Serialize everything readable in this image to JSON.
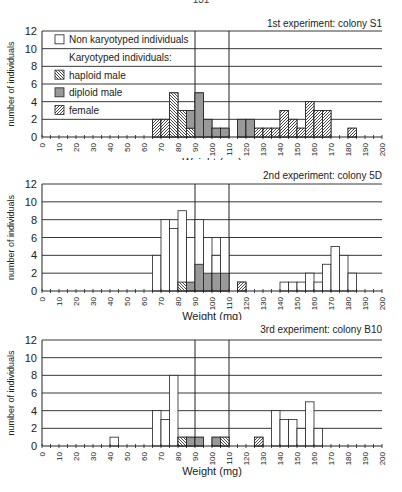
{
  "page_number": "131",
  "legend": {
    "non_karyotyped": "Non karyotyped individuals",
    "karyotyped_header": "Karyotyped individuals:",
    "haploid": "haploid male",
    "diploid": "diploid male",
    "female": "female"
  },
  "chart_data": [
    {
      "type": "bar",
      "title": "1st experiment: colony S1",
      "xlabel": "Weight (mg)",
      "ylabel": "number of individuals",
      "xlim": [
        0,
        200
      ],
      "ylim": [
        0,
        12
      ],
      "xticks": [
        0,
        10,
        20,
        30,
        40,
        50,
        60,
        70,
        80,
        90,
        100,
        110,
        120,
        130,
        140,
        150,
        160,
        170,
        180,
        190,
        200
      ],
      "yticks": [
        0,
        2,
        4,
        6,
        8,
        10,
        12
      ],
      "bin_width": 5,
      "reference_lines_x": [
        90,
        110
      ],
      "legend_position": "upper-left",
      "bins": [
        {
          "x": 65,
          "total": 2,
          "female": 2
        },
        {
          "x": 70,
          "total": 2,
          "female": 2
        },
        {
          "x": 75,
          "total": 5,
          "haploid": 5
        },
        {
          "x": 80,
          "total": 3,
          "haploid": 3
        },
        {
          "x": 85,
          "total": 3,
          "haploid": 1,
          "diploid": 2
        },
        {
          "x": 90,
          "total": 5,
          "diploid": 5
        },
        {
          "x": 95,
          "total": 2,
          "diploid": 2
        },
        {
          "x": 100,
          "total": 1,
          "diploid": 1
        },
        {
          "x": 105,
          "total": 1,
          "diploid": 1
        },
        {
          "x": 115,
          "total": 2,
          "diploid": 2
        },
        {
          "x": 120,
          "total": 2,
          "diploid": 2
        },
        {
          "x": 125,
          "total": 1,
          "female": 1
        },
        {
          "x": 130,
          "total": 1,
          "female": 1
        },
        {
          "x": 135,
          "total": 1,
          "female": 1
        },
        {
          "x": 140,
          "total": 3,
          "female": 3
        },
        {
          "x": 145,
          "total": 2,
          "female": 2
        },
        {
          "x": 150,
          "total": 1,
          "female": 1
        },
        {
          "x": 155,
          "total": 4,
          "female": 4
        },
        {
          "x": 160,
          "total": 3,
          "female": 3
        },
        {
          "x": 165,
          "total": 3,
          "female": 3
        },
        {
          "x": 180,
          "total": 1,
          "female": 1
        }
      ]
    },
    {
      "type": "bar",
      "title": "2nd experiment: colony 5D",
      "xlabel": "Weight (mg)",
      "ylabel": "number of individuals",
      "xlim": [
        0,
        200
      ],
      "ylim": [
        0,
        12
      ],
      "xticks": [
        0,
        10,
        20,
        30,
        40,
        50,
        60,
        70,
        80,
        90,
        100,
        110,
        120,
        130,
        140,
        150,
        160,
        170,
        180,
        190,
        200
      ],
      "yticks": [
        0,
        2,
        4,
        6,
        8,
        10,
        12
      ],
      "bin_width": 5,
      "reference_lines_x": [
        90,
        110
      ],
      "bins": [
        {
          "x": 65,
          "total": 4
        },
        {
          "x": 70,
          "total": 8
        },
        {
          "x": 75,
          "total": 7
        },
        {
          "x": 80,
          "total": 9,
          "haploid": 1
        },
        {
          "x": 85,
          "total": 6,
          "diploid": 1
        },
        {
          "x": 90,
          "total": 8,
          "diploid": 3
        },
        {
          "x": 95,
          "total": 6,
          "diploid": 2
        },
        {
          "x": 100,
          "total": 4,
          "diploid": 2
        },
        {
          "x": 105,
          "total": 6,
          "diploid": 2
        },
        {
          "x": 115,
          "total": 1,
          "female": 1
        },
        {
          "x": 140,
          "total": 1
        },
        {
          "x": 145,
          "total": 1
        },
        {
          "x": 150,
          "total": 1
        },
        {
          "x": 155,
          "total": 2
        },
        {
          "x": 160,
          "total": 1
        },
        {
          "x": 165,
          "total": 3
        },
        {
          "x": 170,
          "total": 5
        },
        {
          "x": 175,
          "total": 4
        },
        {
          "x": 180,
          "total": 2
        }
      ]
    },
    {
      "type": "bar",
      "title": "3rd experiment: colony B10",
      "xlabel": "Weight (mg)",
      "ylabel": "number of individuals",
      "xlim": [
        0,
        200
      ],
      "ylim": [
        0,
        12
      ],
      "xticks": [
        0,
        10,
        20,
        30,
        40,
        50,
        60,
        70,
        80,
        90,
        100,
        110,
        120,
        130,
        140,
        150,
        160,
        170,
        180,
        190,
        200
      ],
      "yticks": [
        0,
        2,
        4,
        6,
        8,
        10,
        12
      ],
      "bin_width": 5,
      "reference_lines_x": [
        90,
        110
      ],
      "bins": [
        {
          "x": 40,
          "total": 1
        },
        {
          "x": 65,
          "total": 4
        },
        {
          "x": 70,
          "total": 3
        },
        {
          "x": 75,
          "total": 8
        },
        {
          "x": 80,
          "total": 1,
          "haploid": 1
        },
        {
          "x": 85,
          "total": 1,
          "diploid": 1
        },
        {
          "x": 90,
          "total": 1,
          "diploid": 1
        },
        {
          "x": 100,
          "total": 1,
          "diploid": 1
        },
        {
          "x": 105,
          "total": 1,
          "haploid": 1
        },
        {
          "x": 125,
          "total": 1,
          "female": 1
        },
        {
          "x": 135,
          "total": 4
        },
        {
          "x": 140,
          "total": 3
        },
        {
          "x": 145,
          "total": 3
        },
        {
          "x": 150,
          "total": 2
        },
        {
          "x": 155,
          "total": 5
        },
        {
          "x": 160,
          "total": 2
        }
      ]
    }
  ]
}
